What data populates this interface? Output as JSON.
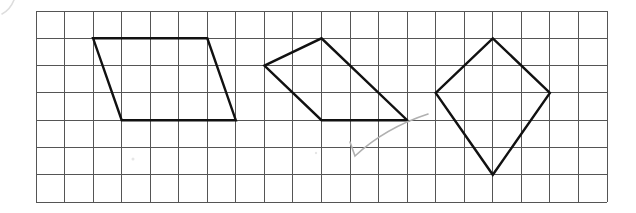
{
  "grid": {
    "origin_x": 36,
    "origin_y": 11,
    "cols": 20,
    "rows": 7,
    "cell_w": 28.55,
    "cell_h": 27.3,
    "line_color": "#555555"
  },
  "shapes": [
    {
      "name": "parallelogram",
      "vertices_grid": [
        [
          2,
          1
        ],
        [
          6,
          1
        ],
        [
          7,
          4
        ],
        [
          3,
          4
        ]
      ]
    },
    {
      "name": "quadrilateral-middle",
      "vertices_grid": [
        [
          8,
          2
        ],
        [
          10,
          1
        ],
        [
          13,
          4
        ],
        [
          10,
          4
        ]
      ]
    },
    {
      "name": "kite",
      "vertices_grid": [
        [
          16,
          1
        ],
        [
          18,
          3
        ],
        [
          16,
          6
        ],
        [
          14,
          3
        ]
      ]
    }
  ],
  "annotations": {
    "checkmark_color": "#b0b0b0",
    "stroke_color": "#111111"
  }
}
